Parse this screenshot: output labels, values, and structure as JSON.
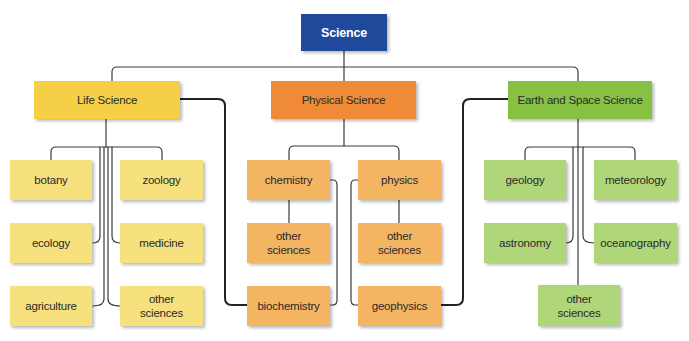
{
  "root": {
    "label": "Science"
  },
  "categories": [
    {
      "label": "Life Science",
      "leaves": [
        "botany",
        "zoology",
        "ecology",
        "medicine",
        "agriculture",
        "other\nsciences"
      ]
    },
    {
      "label": "Physical Science",
      "leaves": [
        "chemistry",
        "physics",
        "other\nsciences",
        "other\nsciences",
        "biochemistry",
        "geophysics"
      ]
    },
    {
      "label": "Earth and Space Science",
      "leaves": [
        "geology",
        "meteorology",
        "astronomy",
        "oceanography",
        "other\nsciences"
      ]
    }
  ],
  "colors": {
    "root": "#1f4a9c",
    "life_main": "#f5cf45",
    "life_leaf": "#f7e07e",
    "physical_main": "#ef8b36",
    "physical_leaf": "#f3b562",
    "earth_main": "#86c143",
    "earth_leaf": "#b0d67a",
    "line": "#333333"
  }
}
